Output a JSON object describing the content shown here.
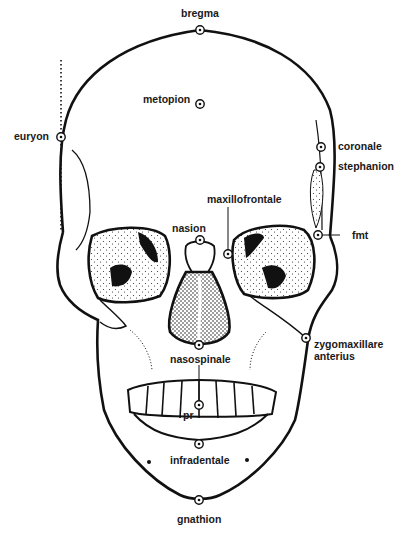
{
  "diagram": {
    "type": "anatomical-line-drawing",
    "colors": {
      "ink": "#111111",
      "label": "#1a1a1a",
      "background": "#ffffff",
      "stipple": "#333333"
    },
    "landmarks": [
      {
        "id": "bregma",
        "label": "bregma",
        "x": 200,
        "y": 30
      },
      {
        "id": "metopion",
        "label": "metopion",
        "x": 200,
        "y": 104
      },
      {
        "id": "euryon",
        "label": "euryon",
        "x": 61,
        "y": 137
      },
      {
        "id": "coronale",
        "label": "coronale",
        "x": 321,
        "y": 147
      },
      {
        "id": "stephanion",
        "label": "stephanion",
        "x": 320,
        "y": 167
      },
      {
        "id": "maxillofrontale",
        "label": "maxillofrontale",
        "x": 228,
        "y": 254
      },
      {
        "id": "nasion",
        "label": "nasion",
        "x": 200,
        "y": 240
      },
      {
        "id": "fmt",
        "label": "fmt",
        "x": 318,
        "y": 235
      },
      {
        "id": "zygomaxillare-anterius",
        "label": "zygomaxillare\nanterius",
        "x": 306,
        "y": 338
      },
      {
        "id": "nasospinale",
        "label": "nasospinale",
        "x": 199,
        "y": 345
      },
      {
        "id": "pr",
        "label": "pr",
        "x": 199,
        "y": 405
      },
      {
        "id": "infradentale",
        "label": "infradentale",
        "x": 199,
        "y": 444
      },
      {
        "id": "gnathion",
        "label": "gnathion",
        "x": 199,
        "y": 500
      }
    ],
    "labels": {
      "bregma": "bregma",
      "metopion": "metopion",
      "euryon": "euryon",
      "coronale": "coronale",
      "stephanion": "stephanion",
      "maxillofrontale": "maxillofrontale",
      "nasion": "nasion",
      "fmt": "fmt",
      "zygomaxillare": "zygomaxillare\nanterius",
      "nasospinale": "nasospinale",
      "pr": "pr",
      "infradentale": "infradentale",
      "gnathion": "gnathion"
    }
  }
}
